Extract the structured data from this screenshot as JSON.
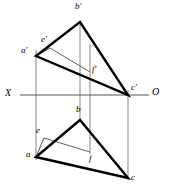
{
  "figure": {
    "type": "descriptive-geometry-projection",
    "width": 171,
    "height": 194,
    "background_color": "#ffffff",
    "stroke_color": "#000000",
    "thin_stroke_color": "#6b6b6b",
    "thick_line_width": 2.4,
    "thin_line_width": 0.8,
    "axis_line_width": 0.9
  },
  "axis": {
    "name": "ground-line",
    "y": 95,
    "x_start": 20,
    "x_end": 149,
    "left_label": "X",
    "right_label": "O",
    "left_label_x": 5,
    "left_label_y": 89,
    "right_label_x": 152,
    "right_label_y": 88
  },
  "points": {
    "a_prime": {
      "label": "a′",
      "x": 36,
      "y": 56,
      "label_x": 22,
      "label_y": 47
    },
    "b_prime": {
      "label": "b′",
      "x": 80,
      "y": 22,
      "label_x": 75,
      "label_y": 3
    },
    "c_prime": {
      "label": "c′",
      "x": 128,
      "y": 95,
      "label_x": 131,
      "label_y": 84
    },
    "e_prime": {
      "label": "e′",
      "x": 50,
      "y": 48,
      "label_x": 42,
      "label_y": 36
    },
    "f_prime": {
      "label": "f′",
      "x": 90,
      "y": 72,
      "label_x": 92,
      "label_y": 66
    },
    "a": {
      "label": "a",
      "x": 36,
      "y": 157,
      "label_x": 26,
      "label_y": 151
    },
    "b": {
      "label": "b",
      "x": 80,
      "y": 120,
      "label_x": 76,
      "label_y": 106
    },
    "c": {
      "label": "c",
      "x": 128,
      "y": 178,
      "label_x": 131,
      "label_y": 174
    },
    "e": {
      "label": "e",
      "x": 44,
      "y": 138,
      "label_x": 36,
      "label_y": 127
    },
    "f": {
      "label": "f",
      "x": 90,
      "y": 152,
      "label_x": 90,
      "label_y": 155
    }
  },
  "upper_view": {
    "name": "frontal-projection",
    "triangle": "36,56 80,22 128,95",
    "segment_ef": "50,48 90,72",
    "edge_ae": "36,56 50,48",
    "edge_bf": "80,22 90,72"
  },
  "lower_view": {
    "name": "horizontal-projection",
    "triangle": "36,157 80,120 128,178",
    "segment_ef": "44,138 90,152",
    "edge_ae": "36,157 44,138",
    "edge_bf": "80,120 90,152"
  },
  "projection_lines": [
    {
      "name": "projector-a",
      "x": 36,
      "y1": 56,
      "y2": 157
    },
    {
      "name": "projector-b",
      "x": 80,
      "y1": 22,
      "y2": 120
    },
    {
      "name": "projector-f",
      "x": 90,
      "y1": 48,
      "y2": 152
    },
    {
      "name": "projector-c",
      "x": 128,
      "y1": 95,
      "y2": 178
    }
  ]
}
